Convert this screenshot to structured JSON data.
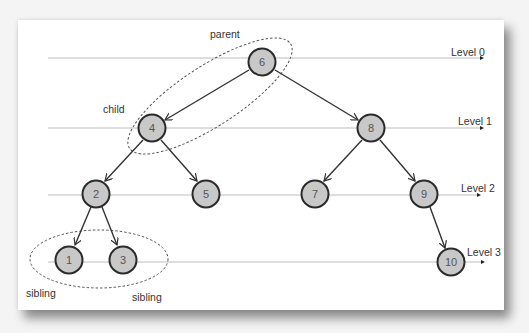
{
  "diagram": {
    "type": "binary-tree",
    "levels": [
      {
        "label": "Level 0",
        "y": 62
      },
      {
        "label": "Level 1",
        "y": 128
      },
      {
        "label": "Level 2",
        "y": 193
      },
      {
        "label": "Level 3",
        "y": 258
      }
    ],
    "nodes": [
      {
        "id": "6",
        "label": "6",
        "x": 262,
        "y": 62,
        "level": 0
      },
      {
        "id": "4",
        "label": "4",
        "x": 152,
        "y": 128,
        "level": 1
      },
      {
        "id": "8",
        "label": "8",
        "x": 371,
        "y": 128,
        "level": 1
      },
      {
        "id": "2",
        "label": "2",
        "x": 96,
        "y": 193,
        "level": 2
      },
      {
        "id": "5",
        "label": "5",
        "x": 206,
        "y": 193,
        "level": 2
      },
      {
        "id": "7",
        "label": "7",
        "x": 315,
        "y": 193,
        "level": 2
      },
      {
        "id": "9",
        "label": "9",
        "x": 424,
        "y": 193,
        "level": 2
      },
      {
        "id": "1",
        "label": "1",
        "x": 69,
        "y": 258,
        "level": 3
      },
      {
        "id": "3",
        "label": "3",
        "x": 123,
        "y": 258,
        "level": 3
      },
      {
        "id": "10",
        "label": "10",
        "x": 451,
        "y": 262,
        "level": 3
      }
    ],
    "edges": [
      [
        "6",
        "4"
      ],
      [
        "6",
        "8"
      ],
      [
        "4",
        "2"
      ],
      [
        "4",
        "5"
      ],
      [
        "8",
        "7"
      ],
      [
        "8",
        "9"
      ],
      [
        "2",
        "1"
      ],
      [
        "2",
        "3"
      ],
      [
        "9",
        "10"
      ]
    ],
    "annotations": {
      "parent": "parent",
      "child": "child",
      "sibling_left": "sibling",
      "sibling_right": "sibling"
    },
    "colors": {
      "node_fill": "#c8c8c8",
      "node_stroke": "#2a2a2a",
      "level_line": "#bdbdbd",
      "edge": "#333333"
    }
  }
}
